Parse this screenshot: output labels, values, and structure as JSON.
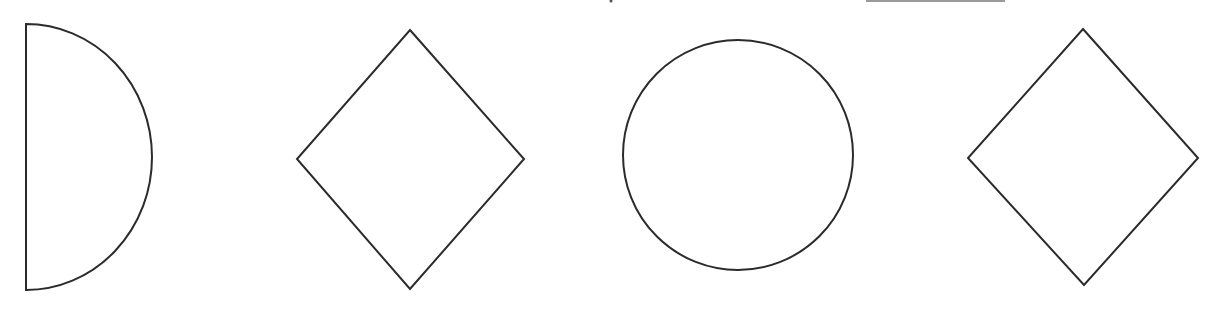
{
  "figure": {
    "stroke_color": "#2b2b2b",
    "background_color": "#ffffff",
    "shapes": [
      {
        "index": 0,
        "type": "semicircle",
        "label": "half-circle (D shape)",
        "flat_x": 26,
        "top_y": 24,
        "bottom_y": 290,
        "arc_extent_x": 152
      },
      {
        "index": 1,
        "type": "diamond",
        "label": "rhombus",
        "points": [
          [
            410,
            30
          ],
          [
            524,
            159
          ],
          [
            410,
            289
          ],
          [
            297,
            159
          ]
        ]
      },
      {
        "index": 2,
        "type": "circle",
        "label": "circle",
        "cx": 738,
        "cy": 155,
        "r": 115
      },
      {
        "index": 3,
        "type": "diamond",
        "label": "rhombus",
        "points": [
          [
            1083,
            29
          ],
          [
            1198,
            158
          ],
          [
            1084,
            285
          ],
          [
            968,
            158
          ]
        ]
      }
    ]
  }
}
